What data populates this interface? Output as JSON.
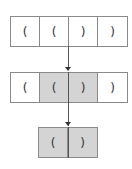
{
  "rows": [
    {
      "name": "input-row",
      "cells": [
        {
          "label": "(",
          "shaded": false
        },
        {
          "label": "(",
          "shaded": false
        },
        {
          "label": ")",
          "shaded": false
        },
        {
          "label": ")",
          "shaded": false
        }
      ]
    },
    {
      "name": "match-row",
      "cells": [
        {
          "label": "(",
          "shaded": false
        },
        {
          "label": "(",
          "shaded": true
        },
        {
          "label": ")",
          "shaded": true
        },
        {
          "label": ")",
          "shaded": false
        }
      ]
    },
    {
      "name": "result-row",
      "cells": [
        {
          "label": "(",
          "shaded": true
        },
        {
          "label": ")",
          "shaded": true
        }
      ]
    }
  ],
  "colors": {
    "border": "#8a8a8a",
    "shade": "#d4d4d4",
    "arrow": "#555555"
  }
}
